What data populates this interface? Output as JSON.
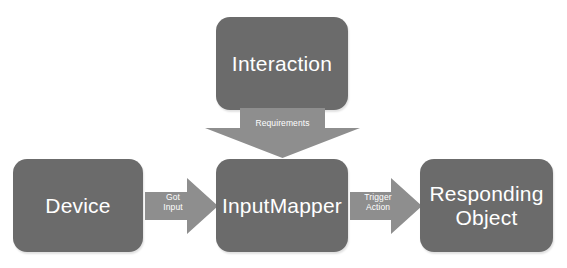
{
  "diagram": {
    "colors": {
      "background": "#ffffff",
      "node_fill": "#6b6b6b",
      "node_text": "#ffffff",
      "arrow_fill": "#8e8e8e",
      "arrow_text": "#ffffff"
    },
    "nodes": [
      {
        "id": "interaction",
        "label": "Interaction"
      },
      {
        "id": "device",
        "label": "Device"
      },
      {
        "id": "inputmapper",
        "label": "InputMapper"
      },
      {
        "id": "responding",
        "label": "Responding\nObject"
      }
    ],
    "arrows": [
      {
        "id": "requirements",
        "label": "Requirements",
        "from": "interaction",
        "to": "inputmapper",
        "direction": "down"
      },
      {
        "id": "got-input",
        "label": "Got\nInput",
        "from": "device",
        "to": "inputmapper",
        "direction": "right"
      },
      {
        "id": "trigger-action",
        "label": "Trigger\nAction",
        "from": "inputmapper",
        "to": "responding",
        "direction": "right"
      }
    ]
  }
}
